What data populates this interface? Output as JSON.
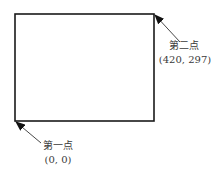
{
  "diagram": {
    "rectangle": {
      "x1": 15,
      "y1": 14,
      "x2": 154,
      "y2": 121,
      "stroke": "#1a1a1a"
    },
    "points": [
      {
        "id": "first",
        "name": "第一点",
        "coords": "(0, 0)",
        "corner": "bottom-left"
      },
      {
        "id": "second",
        "name": "第二点",
        "coords": "(420, 297)",
        "corner": "top-right"
      }
    ]
  }
}
